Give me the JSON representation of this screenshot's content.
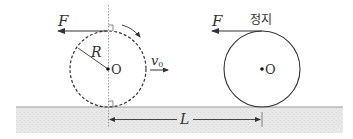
{
  "diagram": {
    "colors": {
      "line": "#333333",
      "ground_fill": "#e6e6e6",
      "ground_edge": "#999999",
      "guide": "#888888"
    },
    "left_object": {
      "force_label": "F",
      "radius_label": "R",
      "center_label": "O",
      "velocity_label": "v",
      "velocity_subscript": "0",
      "style": "dashed-circle"
    },
    "right_object": {
      "force_label": "F",
      "state_label": "정지",
      "center_label": "O",
      "style": "solid-circle"
    },
    "distance_label": "L"
  }
}
